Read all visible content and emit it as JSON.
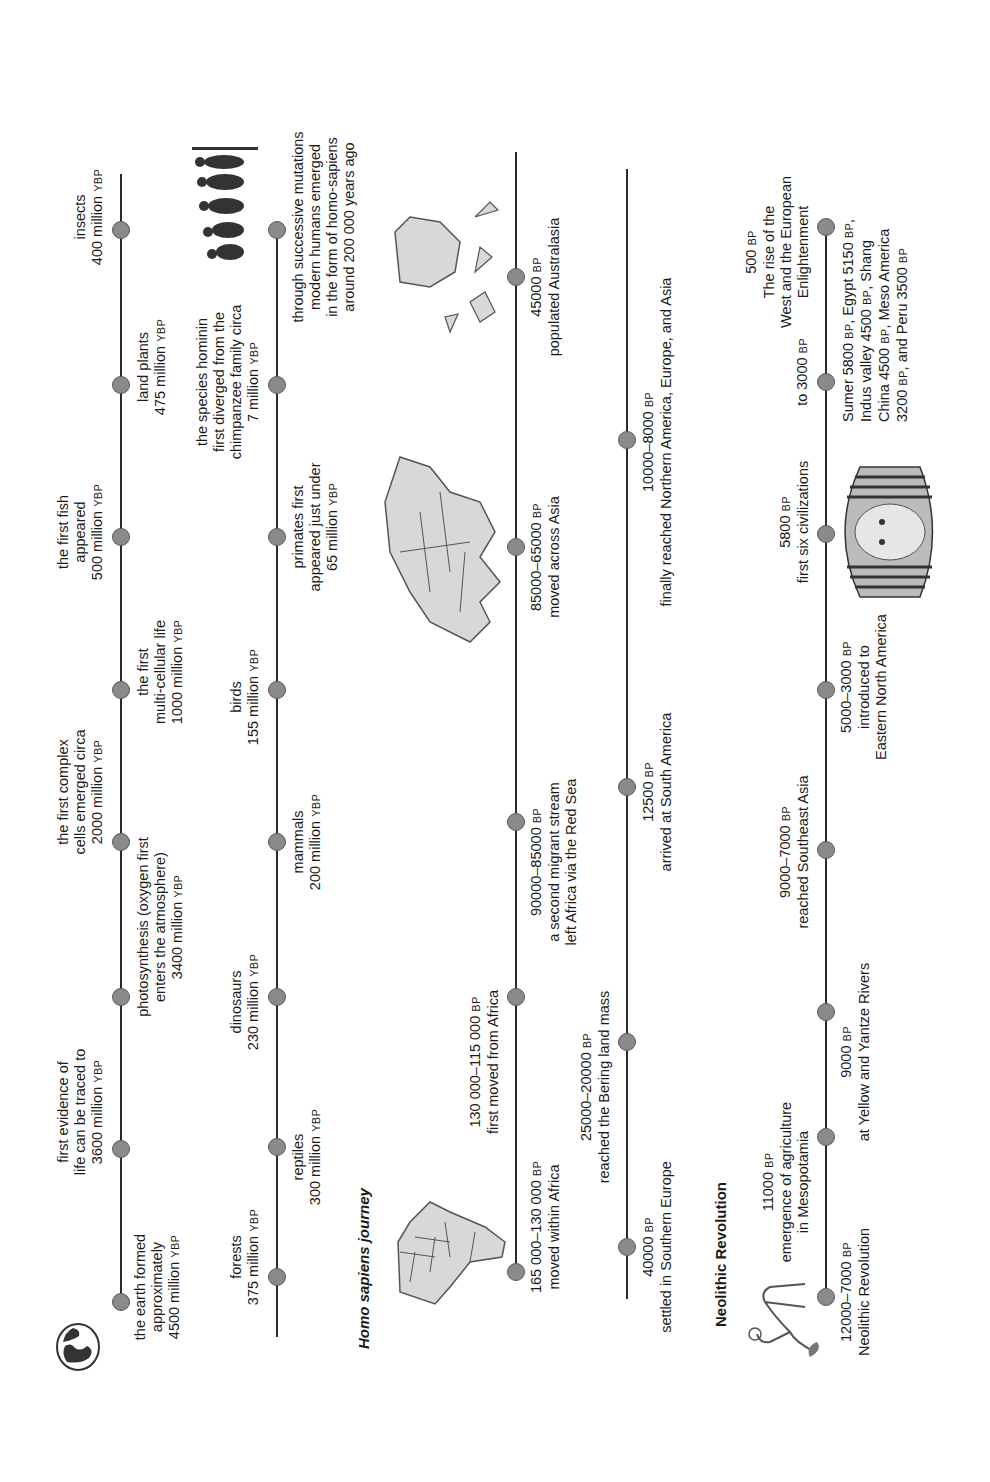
{
  "timeline_1": {
    "events": [
      {
        "desc": "the earth formed\napproximately\n4500 million",
        "unit": "YBP"
      },
      {
        "desc": "first evidence of\nlife can be traced to\n3600 million",
        "unit": "YBP"
      },
      {
        "desc": "photosynthesis (oxygen first\nenters the atmosphere)\n3400 million",
        "unit": "YBP"
      },
      {
        "desc": "the first complex\ncells emerged circa\n2000 million",
        "unit": "YBP"
      },
      {
        "desc": "the first\nmulti-cellular life\n1000 million",
        "unit": "YBP"
      },
      {
        "desc": "the first fish\nappeared\n500 million",
        "unit": "YBP"
      },
      {
        "desc": "land plants\n475 million",
        "unit": "YBP"
      },
      {
        "desc": "insects\n400 million",
        "unit": "YBP"
      }
    ]
  },
  "timeline_2": {
    "events": [
      {
        "desc": "forests\n375 million",
        "unit": "YBP"
      },
      {
        "desc": "reptiles\n300 million",
        "unit": "YBP"
      },
      {
        "desc": "dinosaurs\n230 million",
        "unit": "YBP"
      },
      {
        "desc": "mammals\n200 million",
        "unit": "YBP"
      },
      {
        "desc": "birds\n155 million",
        "unit": "YBP"
      },
      {
        "desc": "primates first\nappeared just under\n65 million",
        "unit": "YBP"
      },
      {
        "desc": "the species hominin\nfirst diverged from the\nchimpanzee family circa\n7 million",
        "unit": "YBP"
      },
      {
        "desc": "through successive mutations\nmodern humans emerged\nin the form of homo-sapiens\naround 200 000 years ago",
        "unit": ""
      }
    ]
  },
  "homo_sapiens": {
    "title": "Homo sapiens journey",
    "row_a": [
      {
        "date": "165 000–130 000",
        "unit": "BP",
        "desc": "moved within Africa"
      },
      {
        "date": "130 000–115 000",
        "unit": "BP",
        "desc": "first moved from Africa"
      },
      {
        "date": "90000–85000",
        "unit": "BP",
        "desc": "a second migrant stream\nleft Africa via the Red Sea"
      },
      {
        "date": "85000–65000",
        "unit": "BP",
        "desc": "moved across Asia"
      },
      {
        "date": "45000",
        "unit": "BP",
        "desc": "populated Australasia"
      }
    ],
    "row_b": [
      {
        "date": "40000",
        "unit": "BP",
        "desc": "settled in Southern Europe"
      },
      {
        "date": "25000–20000",
        "unit": "BP",
        "desc": "reached the Bering land mass"
      },
      {
        "date": "12500",
        "unit": "BP",
        "desc": "arrived at South America"
      },
      {
        "date": "10000–8000",
        "unit": "BP",
        "desc": "finally reached Northern America, Europe, and Asia"
      }
    ]
  },
  "neolithic": {
    "title": "Neolithic Revolution",
    "events": [
      {
        "date": "12000–7000",
        "unit": "BP",
        "desc": "Neolithic Revolution"
      },
      {
        "date": "11000",
        "unit": "BP",
        "desc": "emergence of agriculture\nin Mesopotamia"
      },
      {
        "date": "9000",
        "unit": "BP",
        "desc": "at Yellow and Yantze Rivers"
      },
      {
        "date": "9000–7000",
        "unit": "BP",
        "desc": "reached Southeast Asia"
      },
      {
        "date": "5000–3000",
        "unit": "BP",
        "desc": "introduced to\nEastern North America"
      },
      {
        "date": "5800",
        "unit": "BP",
        "desc": "first six civilizations"
      },
      {
        "date": "to 3000",
        "unit": "BP",
        "desc": ""
      },
      {
        "date": "500",
        "unit": "BP",
        "desc": "The rise of the\nWest and the European\nEnlightenment"
      }
    ],
    "civilizations_note": {
      "l1a": "Sumer 5800 ",
      "l1u1": "BP",
      "l1b": ", Egypt 5150 ",
      "l1u2": "BP",
      "l1c": ",",
      "l2a": "Indus valley 4500 ",
      "l2u": "BP",
      "l2b": ", Shang",
      "l3a": "China 4500 ",
      "l3u": "BP",
      "l3b": ", Meso America",
      "l4a": "3200 ",
      "l4u1": "BP",
      "l4b": ", and Peru 3500 ",
      "l4u2": "BP"
    }
  },
  "images": {
    "globe": "globe-icon",
    "evolution": "human-evolution-silhouettes",
    "africa": "africa-map",
    "asia": "asia-map",
    "australasia": "australasia-map",
    "farmer": "neolithic-farmer-drawing",
    "pharaoh": "tutankhamun-mask"
  },
  "colors": {
    "line": "#2a2a2a",
    "dot_fill": "#8a8a8a",
    "dot_stroke": "#5a5a5a",
    "map_fill": "#d8d8d8",
    "map_stroke": "#555555"
  }
}
